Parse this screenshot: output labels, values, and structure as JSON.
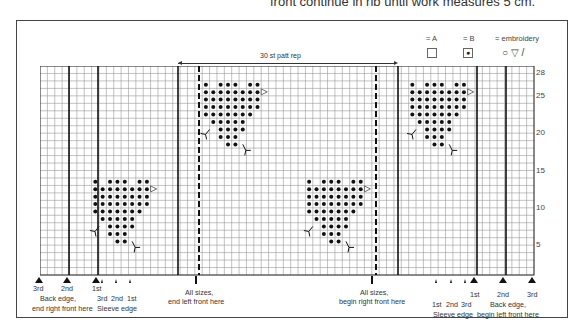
{
  "header": {
    "text": "front continue in rib until work measures 5 cm."
  },
  "legend": {
    "a_label": "= A",
    "b_label": "= B",
    "emb_label": "= embroidery",
    "emb_symbols": "○ ▽ /"
  },
  "repeat": {
    "label": "30 st patt rep"
  },
  "row_numbers": [
    "28",
    "25",
    "20",
    "15",
    "10",
    "5"
  ],
  "bottom_labels": {
    "left_sizes": [
      "3rd",
      "2nd",
      "1st"
    ],
    "left_back": "Back edge,",
    "left_back2": "end right front here",
    "left_sleeve_sizes": [
      "3rd",
      "2nd",
      "1st"
    ],
    "left_sleeve": "Sleeve edge",
    "all_sizes_left": "All sizes,",
    "all_sizes_left2": "end left front here",
    "all_sizes_right": "All sizes,",
    "all_sizes_right2": "begin right front here",
    "right_sleeve_sizes": [
      "1st",
      "2nd",
      "3rd"
    ],
    "right_sleeve": "Sleeve edge",
    "right_sizes": [
      "1st",
      "2nd",
      "3rd"
    ],
    "right_back": "Back edge,",
    "right_back2": "begin left front here"
  },
  "chart_data": {
    "type": "knitting-chart",
    "columns": 67,
    "rows": 28,
    "thick_lines_x": [
      69,
      98,
      178,
      398,
      477,
      506
    ],
    "dashed_lines_x": [
      199,
      376
    ],
    "motif": [
      [
        0,
        2,
        3,
        4,
        6,
        7
      ],
      [
        0,
        1,
        2,
        3,
        4,
        5,
        6,
        7
      ],
      [
        0,
        1,
        2,
        3,
        4,
        5,
        6,
        7
      ],
      [
        0,
        1,
        2,
        3,
        4,
        5,
        6,
        7
      ],
      [
        0,
        1,
        2,
        3,
        4,
        5,
        6
      ],
      [
        1,
        2,
        3,
        4,
        5
      ],
      [
        2,
        3,
        4,
        5
      ],
      [
        2,
        3,
        4
      ],
      [
        3,
        4
      ]
    ],
    "motif_positions": [
      [
        7,
        15
      ],
      [
        22,
        2
      ],
      [
        36,
        15
      ],
      [
        50,
        2
      ]
    ]
  }
}
